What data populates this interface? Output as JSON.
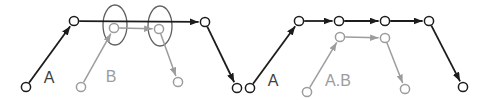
{
  "canvas": {
    "width": 487,
    "height": 100,
    "background": "#ffffff"
  },
  "colors": {
    "black": "#1c1c1c",
    "gray": "#9c9c9c",
    "ellipse_outline": "#5f5f5f",
    "label_dark": "#3f3f3f",
    "label_gray": "#9c9c9c",
    "node_fill": "#ffffff"
  },
  "node_radius": 4.6,
  "diagrams": [
    {
      "name": "left-graph",
      "labels_shown": [
        "A",
        "B"
      ]
    },
    {
      "name": "right-graph",
      "labels_shown": [
        "A",
        "A.B"
      ]
    }
  ],
  "nodes": [
    {
      "id": "L1",
      "x": 26,
      "y": 87,
      "tone": "black"
    },
    {
      "id": "L2",
      "x": 74,
      "y": 21,
      "tone": "black"
    },
    {
      "id": "L3",
      "x": 205,
      "y": 22,
      "tone": "black"
    },
    {
      "id": "L4",
      "x": 237,
      "y": 88,
      "tone": "black"
    },
    {
      "id": "LB1",
      "x": 81,
      "y": 87,
      "tone": "gray"
    },
    {
      "id": "LB2",
      "x": 114,
      "y": 28,
      "tone": "gray"
    },
    {
      "id": "LB3",
      "x": 159,
      "y": 29,
      "tone": "gray"
    },
    {
      "id": "LB4",
      "x": 178,
      "y": 82,
      "tone": "gray"
    },
    {
      "id": "R1",
      "x": 250,
      "y": 88,
      "tone": "black"
    },
    {
      "id": "R2",
      "x": 299,
      "y": 21,
      "tone": "black"
    },
    {
      "id": "R3",
      "x": 339,
      "y": 21,
      "tone": "black"
    },
    {
      "id": "R4",
      "x": 385,
      "y": 21,
      "tone": "black"
    },
    {
      "id": "R5",
      "x": 429,
      "y": 21,
      "tone": "black"
    },
    {
      "id": "R6",
      "x": 463,
      "y": 87,
      "tone": "black"
    },
    {
      "id": "RB1",
      "x": 307,
      "y": 92,
      "tone": "gray"
    },
    {
      "id": "RB2",
      "x": 340,
      "y": 37,
      "tone": "gray"
    },
    {
      "id": "RB3",
      "x": 385,
      "y": 38,
      "tone": "gray"
    },
    {
      "id": "RB4",
      "x": 405,
      "y": 89,
      "tone": "gray"
    }
  ],
  "edges": [
    {
      "from": "L1",
      "to": "L2",
      "tone": "black"
    },
    {
      "from": "L2",
      "to": "L3",
      "tone": "black"
    },
    {
      "from": "L3",
      "to": "L4",
      "tone": "black"
    },
    {
      "from": "LB1",
      "to": "LB2",
      "tone": "gray"
    },
    {
      "from": "LB2",
      "to": "LB3",
      "tone": "gray"
    },
    {
      "from": "LB3",
      "to": "LB4",
      "tone": "gray"
    },
    {
      "from": "R1",
      "to": "R2",
      "tone": "black"
    },
    {
      "from": "R2",
      "to": "R3",
      "tone": "black"
    },
    {
      "from": "R3",
      "to": "R4",
      "tone": "black"
    },
    {
      "from": "R4",
      "to": "R5",
      "tone": "black"
    },
    {
      "from": "R5",
      "to": "R6",
      "tone": "black"
    },
    {
      "from": "RB1",
      "to": "RB2",
      "tone": "gray"
    },
    {
      "from": "RB2",
      "to": "RB3",
      "tone": "gray"
    },
    {
      "from": "RB3",
      "to": "RB4",
      "tone": "gray"
    }
  ],
  "group_ellipses": [
    {
      "cx": 115,
      "cy": 25,
      "rx": 12,
      "ry": 20
    },
    {
      "cx": 160,
      "cy": 26,
      "rx": 12,
      "ry": 20
    }
  ],
  "labels": [
    {
      "text": "A",
      "x": 49,
      "y": 83,
      "tone": "dark"
    },
    {
      "text": "B",
      "x": 111,
      "y": 82,
      "tone": "gray"
    },
    {
      "text": "A",
      "x": 273,
      "y": 86,
      "tone": "dark"
    },
    {
      "text": "A.B",
      "x": 338,
      "y": 86,
      "tone": "gray"
    }
  ]
}
